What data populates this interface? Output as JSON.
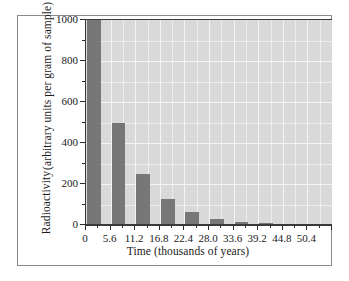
{
  "chart_data": {
    "type": "bar",
    "title": "",
    "subtitle": "",
    "xlabel": "Time (thousands of years)",
    "ylabel_line1": "Radioactivity",
    "ylabel_line2": "(arbitrary units per gram of sample)",
    "categories": [
      "0",
      "5.6",
      "11.2",
      "16.8",
      "22.4",
      "28.0",
      "33.6",
      "39.2",
      "44.8",
      "50.4"
    ],
    "values": [
      1000,
      500,
      250,
      125,
      62.5,
      31.3,
      15.6,
      7.8,
      3.9,
      2.0
    ],
    "x_tick_labels": [
      "0",
      "5.6",
      "11.2",
      "16.8",
      "22.4",
      "28.0",
      "33.6",
      "39.2",
      "44.8",
      "50.4"
    ],
    "y_tick_labels": [
      "0",
      "200",
      "400",
      "600",
      "800",
      "1000"
    ],
    "y_tick_values": [
      0,
      200,
      400,
      600,
      800,
      1000
    ],
    "ylim": [
      0,
      1000
    ],
    "xlim": [
      0,
      56
    ],
    "grid": true,
    "legend": false,
    "legend_position": "none",
    "bar_color": "#777777",
    "plot_background": "#d9d9d9",
    "gridline_color": "#f4f4f4",
    "axis_color": "#3a3a3a",
    "frame_color": "#8a8a8a",
    "annotation": "Radioactive decay with half-life of 5.6 thousand years"
  }
}
